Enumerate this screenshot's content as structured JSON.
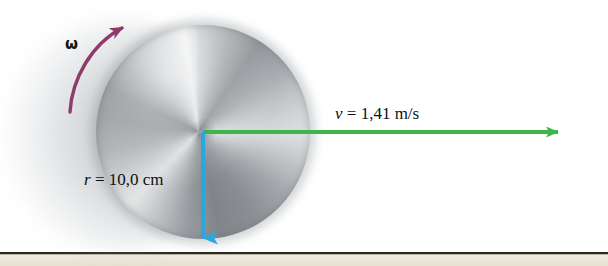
{
  "figure": {
    "background_color": "#ffffff"
  },
  "ground": {
    "line_color": "#2d2a26",
    "band_color": "#eae6d6"
  },
  "disc": {
    "name": "rolling-disc",
    "center_x": 203,
    "center_y": 132,
    "radius_px": 107,
    "material": "brushed-metal",
    "base_color": "#b8bcc0"
  },
  "labels": {
    "omega": "ω",
    "radius_symbol": "r",
    "radius_equals": " = 10,0 cm",
    "velocity_symbol": "v",
    "velocity_equals": " = 1,41 m/s"
  },
  "vectors": {
    "velocity": {
      "name": "velocity-vector",
      "color": "#3cb54a",
      "label": "v = 1,41 m/s",
      "value": 1.41,
      "unit": "m/s",
      "from_x": 203,
      "from_y": 132,
      "to_x": 570,
      "to_y": 132,
      "direction": "right"
    },
    "radius": {
      "name": "radius-vector",
      "color": "#29a8e0",
      "label": "r = 10,0 cm",
      "value": 10.0,
      "unit": "cm",
      "from_x": 203,
      "from_y": 132,
      "to_x": 203,
      "to_y": 254,
      "direction": "down"
    },
    "angular_velocity": {
      "name": "angular-velocity-arc",
      "color": "#8e3a6b",
      "label": "ω",
      "direction": "counterclockwise"
    }
  }
}
